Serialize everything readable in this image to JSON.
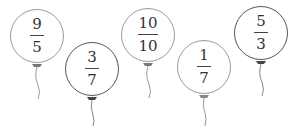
{
  "balloons": [
    {
      "numerator": "9",
      "denominator": "5",
      "cx": 37,
      "cy": 36,
      "r": 27,
      "outline": "#9a9a9a",
      "string_len": 40
    },
    {
      "numerator": "3",
      "denominator": "7",
      "cx": 92,
      "cy": 69,
      "r": 27,
      "outline": "#555555",
      "string_len": 32
    },
    {
      "numerator": "10",
      "denominator": "10",
      "cx": 148,
      "cy": 35,
      "r": 27,
      "outline": "#9a9a9a",
      "string_len": 40
    },
    {
      "numerator": "1",
      "denominator": "7",
      "cx": 204,
      "cy": 67,
      "r": 27,
      "outline": "#9a9a9a",
      "string_len": 32
    },
    {
      "numerator": "5",
      "denominator": "3",
      "cx": 261,
      "cy": 33,
      "r": 27,
      "outline": "#555555",
      "string_len": 40
    }
  ]
}
